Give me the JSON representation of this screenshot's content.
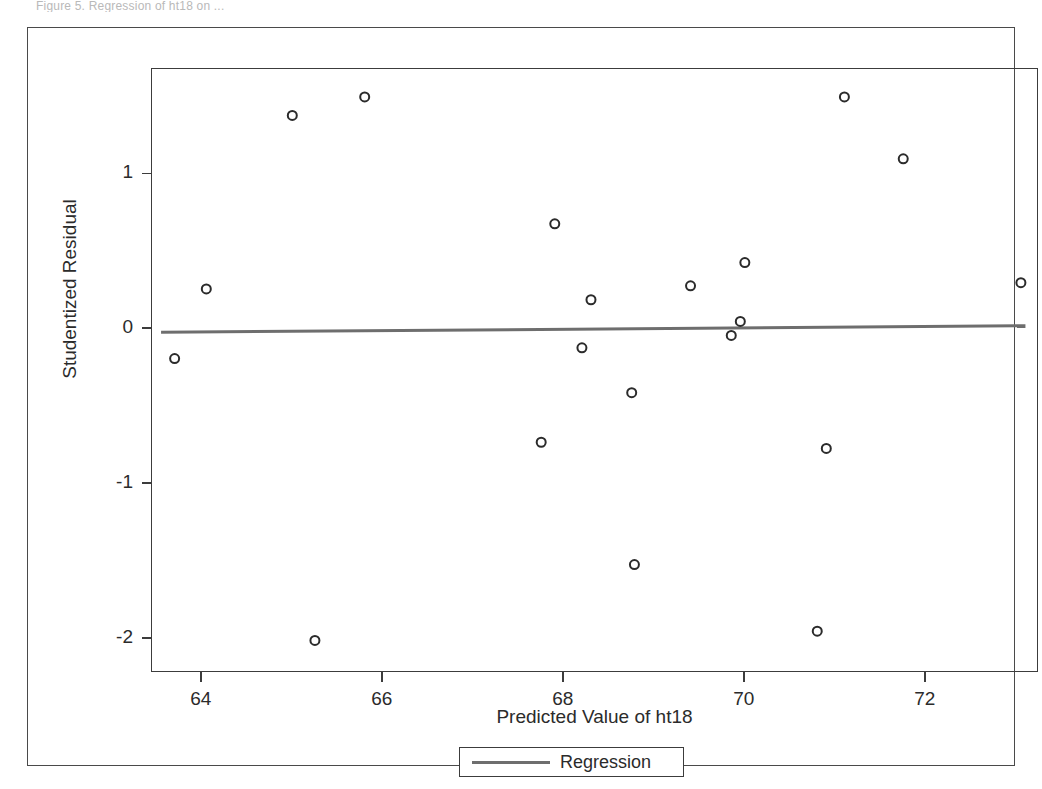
{
  "page": {
    "top_clipped_text": "Figure 5.  Regression of ht18 on  ..."
  },
  "axis": {
    "x_title": "Predicted Value of ht18",
    "y_title": "Studentized Residual",
    "x_ticks": [
      "64",
      "66",
      "68",
      "70",
      "72"
    ],
    "y_ticks": [
      "1",
      "0",
      "-1",
      "-2"
    ]
  },
  "legend": {
    "entries": [
      {
        "label": "Regression",
        "color": "#6e6e6e",
        "marker": "line"
      }
    ]
  },
  "chart_data": {
    "type": "scatter",
    "title": "",
    "xlabel": "Predicted Value of ht18",
    "ylabel": "Studentized Residual",
    "xlim": [
      63.45,
      73.25
    ],
    "ylim": [
      -2.22,
      1.68
    ],
    "xticks": [
      64,
      66,
      68,
      70,
      72
    ],
    "yticks": [
      1,
      0,
      -1,
      -2
    ],
    "grid": false,
    "legend_position": "bottom-center",
    "marker": {
      "shape": "open-circle",
      "size": 9,
      "edge_color": "#2b2b2b",
      "fill": "none"
    },
    "points": [
      {
        "x": 63.7,
        "y": -0.19
      },
      {
        "x": 64.05,
        "y": 0.26
      },
      {
        "x": 65.0,
        "y": 1.38
      },
      {
        "x": 65.25,
        "y": -2.01
      },
      {
        "x": 65.8,
        "y": 1.5
      },
      {
        "x": 67.75,
        "y": -0.73
      },
      {
        "x": 67.9,
        "y": 0.68
      },
      {
        "x": 68.2,
        "y": -0.12
      },
      {
        "x": 68.3,
        "y": 0.19
      },
      {
        "x": 68.75,
        "y": -0.41
      },
      {
        "x": 68.78,
        "y": -1.52
      },
      {
        "x": 69.4,
        "y": 0.28
      },
      {
        "x": 69.85,
        "y": -0.04
      },
      {
        "x": 69.95,
        "y": 0.05
      },
      {
        "x": 70.0,
        "y": 0.43
      },
      {
        "x": 70.8,
        "y": -1.95
      },
      {
        "x": 70.9,
        "y": -0.77
      },
      {
        "x": 71.1,
        "y": 1.5
      },
      {
        "x": 71.75,
        "y": 1.1
      },
      {
        "x": 73.05,
        "y": 0.3
      }
    ],
    "series": [
      {
        "name": "Regression",
        "type": "line",
        "color": "#6e6e6e",
        "width": 3,
        "endpoints": [
          {
            "x": 63.55,
            "y": -0.02
          },
          {
            "x": 73.1,
            "y": 0.022
          }
        ]
      }
    ]
  }
}
